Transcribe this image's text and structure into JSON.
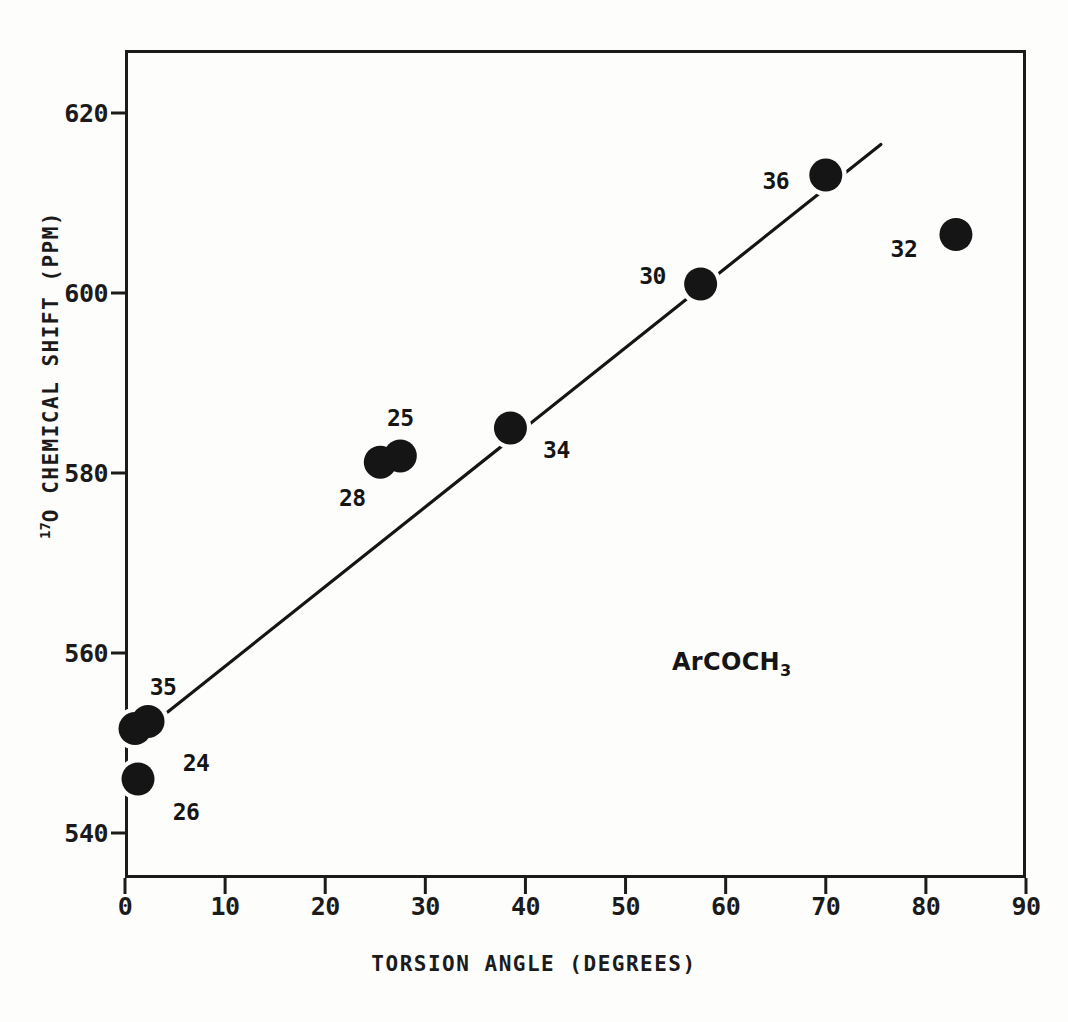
{
  "chart_data": {
    "type": "scatter",
    "title": "",
    "xlabel": "TORSION ANGLE (DEGREES)",
    "ylabel": "17O CHEMICAL SHIFT (PPM)",
    "ylabel_superscript": "17",
    "ylabel_rest": "O CHEMICAL SHIFT (PPM)",
    "xlim": [
      0,
      90
    ],
    "ylim": [
      535,
      627
    ],
    "xticks": [
      0,
      10,
      20,
      30,
      40,
      50,
      60,
      70,
      80,
      90
    ],
    "yticks": [
      540,
      560,
      580,
      600,
      620
    ],
    "xtick_labels": [
      "0",
      "10",
      "20",
      "30",
      "40",
      "50",
      "60",
      "70",
      "80",
      "90"
    ],
    "ytick_labels": [
      "540",
      "560",
      "580",
      "600",
      "620"
    ],
    "grid": false,
    "legend": null,
    "annotation": "ArCOCH3",
    "annotation_base": "ArCOCH",
    "annotation_sub": "3",
    "marker_color": "#151515",
    "line_color": "#151515",
    "axis_color": "#1b1b1b",
    "points": [
      {
        "label": "35",
        "x": 1.0,
        "y": 551.6,
        "label_dx": 28,
        "label_dy": -42
      },
      {
        "label": "24",
        "x": 2.3,
        "y": 552.4,
        "label_dx": 48,
        "label_dy": 42
      },
      {
        "label": "26",
        "x": 1.3,
        "y": 546.0,
        "label_dx": 48,
        "label_dy": 33
      },
      {
        "label": "28",
        "x": 25.5,
        "y": 581.2,
        "label_dx": -28,
        "label_dy": 36
      },
      {
        "label": "25",
        "x": 27.5,
        "y": 581.9,
        "label_dx": 0,
        "label_dy": -38
      },
      {
        "label": "34",
        "x": 38.5,
        "y": 585.0,
        "label_dx": 46,
        "label_dy": 22
      },
      {
        "label": "30",
        "x": 57.5,
        "y": 601.0,
        "label_dx": -48,
        "label_dy": -8
      },
      {
        "label": "36",
        "x": 70.0,
        "y": 613.1,
        "label_dx": -50,
        "label_dy": 6
      },
      {
        "label": "32",
        "x": 83.0,
        "y": 606.5,
        "label_dx": -52,
        "label_dy": 14
      }
    ],
    "trend_line": {
      "x_start": 1.5,
      "y_start": 551.0,
      "x_end": 75.5,
      "y_end": 616.5
    }
  }
}
